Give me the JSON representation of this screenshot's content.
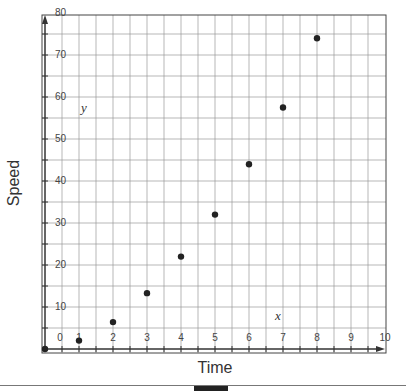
{
  "chart_data": {
    "type": "scatter",
    "title": "",
    "xlabel": "Time",
    "ylabel": "Speed",
    "x_var": "x",
    "y_var": "y",
    "x": [
      0,
      1,
      2,
      3,
      4,
      5,
      6,
      7,
      8
    ],
    "y": [
      0,
      2,
      6.4,
      13.3,
      22,
      32,
      44,
      57.5,
      74
    ],
    "xlim": [
      0,
      10
    ],
    "ylim": [
      0,
      80
    ],
    "x_ticks": [
      0,
      1,
      2,
      3,
      4,
      5,
      6,
      7,
      8,
      9,
      10
    ],
    "y_ticks": [
      0,
      10,
      20,
      30,
      40,
      50,
      60,
      70,
      80
    ],
    "x_tick_labels": [
      "0",
      "1",
      "2",
      "3",
      "4",
      "5",
      "6",
      "7",
      "8",
      "9",
      "10"
    ],
    "y_tick_labels": [
      "10",
      "20",
      "30",
      "40",
      "50",
      "60",
      "70",
      "80"
    ],
    "grid": true,
    "grid_minor_x": 0.5,
    "grid_minor_y": 5,
    "legend": null,
    "colors": {
      "point": "#222222",
      "grid": "#999999",
      "axis": "#333333"
    }
  }
}
